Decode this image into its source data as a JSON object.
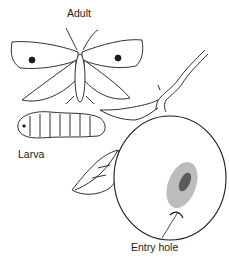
{
  "figure": {
    "labels": {
      "adult": "Adult",
      "larva": "Larva",
      "entry_hole": "Entry hole"
    },
    "colors": {
      "ink": "#1a1a1a",
      "background": "#ffffff"
    }
  }
}
